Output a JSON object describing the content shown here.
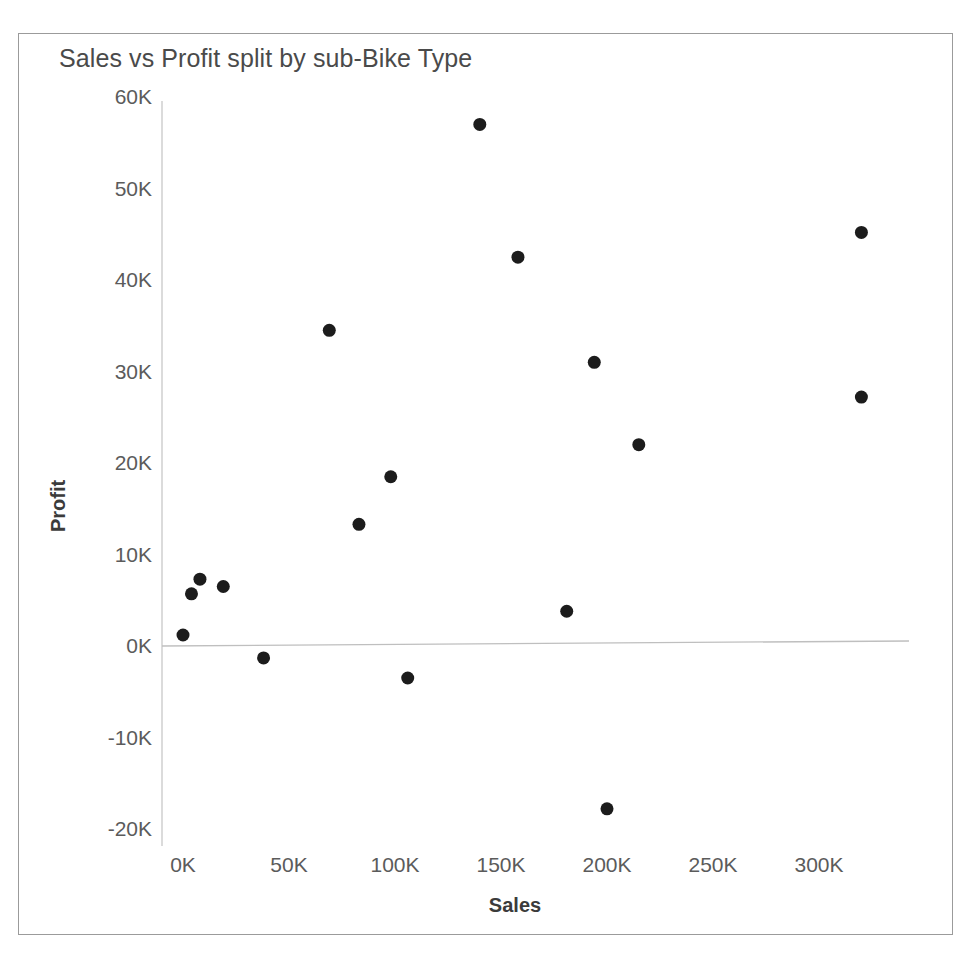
{
  "chart_data": {
    "type": "scatter",
    "title": "Sales vs Profit split by sub-Bike Type",
    "xlabel": "Sales",
    "ylabel": "Profit",
    "xlim": [
      -20000,
      345000
    ],
    "ylim": [
      -22000,
      62000
    ],
    "grid": false,
    "legend": "none",
    "xticks": [
      0,
      50000,
      100000,
      150000,
      200000,
      250000,
      300000
    ],
    "xtick_labels": [
      "0K",
      "50K",
      "100K",
      "150K",
      "200K",
      "250K",
      "300K"
    ],
    "yticks": [
      -20000,
      -10000,
      0,
      10000,
      20000,
      30000,
      40000,
      50000,
      60000
    ],
    "ytick_labels": [
      "-20K",
      "-10K",
      "0K",
      "10K",
      "20K",
      "30K",
      "40K",
      "50K",
      "60K"
    ],
    "zero_reference_line": 0,
    "mark_color": "#1c1c1c",
    "mark_size": 13,
    "points": [
      {
        "x": 0,
        "y": 1200
      },
      {
        "x": 4000,
        "y": 5700
      },
      {
        "x": 8000,
        "y": 7300
      },
      {
        "x": 19000,
        "y": 6500
      },
      {
        "x": 38000,
        "y": -1300
      },
      {
        "x": 69000,
        "y": 34500
      },
      {
        "x": 83000,
        "y": 13300
      },
      {
        "x": 98000,
        "y": 18500
      },
      {
        "x": 106000,
        "y": -3500
      },
      {
        "x": 140000,
        "y": 57000
      },
      {
        "x": 158000,
        "y": 42500
      },
      {
        "x": 181000,
        "y": 3800
      },
      {
        "x": 194000,
        "y": 31000
      },
      {
        "x": 200000,
        "y": -17800
      },
      {
        "x": 215000,
        "y": 22000
      },
      {
        "x": 320000,
        "y": 45200
      },
      {
        "x": 320000,
        "y": 27200
      }
    ]
  },
  "axes": {
    "x_axis_color": "#c8c8c8",
    "y_axis_color": "#c8c8c8",
    "tick_label_color": "#5b5b5b",
    "title_color": "#4a4a4a"
  },
  "frame": {
    "border_color": "#9b9b9b",
    "background": "#ffffff"
  }
}
